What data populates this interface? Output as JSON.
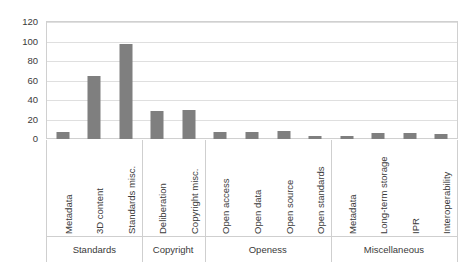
{
  "chart_data": {
    "type": "bar",
    "title": "",
    "subtitle": "",
    "xlabel": "",
    "ylabel": "",
    "ylim": [
      0,
      120
    ],
    "yticks": [
      0,
      20,
      40,
      60,
      80,
      100,
      120
    ],
    "grid": true,
    "legend": false,
    "bar_color": "#7f7f7f",
    "gridline_color": "#dfdfdf",
    "axis_text_color": "#3a3a3a",
    "categories": [
      "Metadata",
      "3D content",
      "Standards misc.",
      "Deliberation",
      "Copyright misc.",
      "Open access",
      "Open data",
      "Open source",
      "Open standards",
      "Metadata",
      "Long-term storage",
      "IPR",
      "Interoperability"
    ],
    "values": [
      7,
      65,
      97,
      29,
      30,
      7,
      7,
      8,
      3,
      3,
      6,
      6,
      5
    ],
    "groups": [
      {
        "label": "Standards",
        "count": 3
      },
      {
        "label": "Copyright",
        "count": 2
      },
      {
        "label": "Openess",
        "count": 4
      },
      {
        "label": "Miscellaneous",
        "count": 4
      }
    ]
  }
}
